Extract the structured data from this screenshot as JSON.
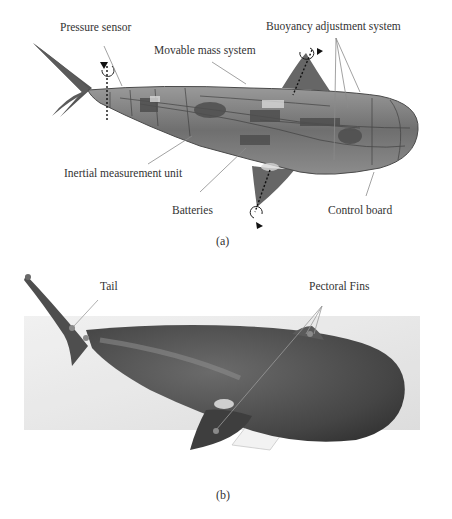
{
  "figure": {
    "panel_a": {
      "caption": "(a)",
      "description": "CAD cutaway of robotic fish",
      "labels": {
        "pressure_sensor": "Pressure sensor",
        "movable_mass": "Movable mass system",
        "buoyancy": "Buoyancy adjustment system",
        "imu": "Inertial measurement unit",
        "batteries": "Batteries",
        "control_board": "Control board"
      }
    },
    "panel_b": {
      "caption": "(b)",
      "description": "Photograph of robotic fish prototype",
      "labels": {
        "tail": "Tail",
        "pectoral_fins": "Pectoral Fins"
      }
    }
  },
  "colors": {
    "background": "#ffffff",
    "body_dark": "#4a4a4a",
    "fin": "#5a5a5a",
    "photo_bg": "#e4e4e4",
    "leader_line": "#8a8a8a",
    "text": "#333333"
  }
}
